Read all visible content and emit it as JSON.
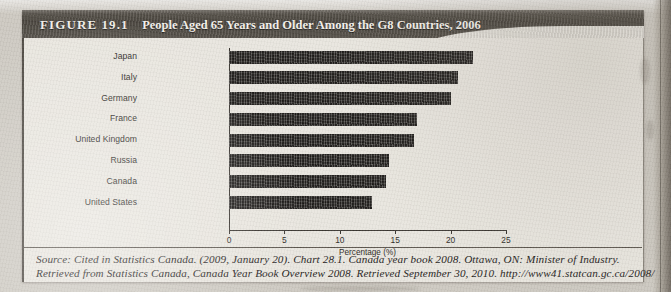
{
  "figure": {
    "number_label": "FIGURE 19.1",
    "title": "People Aged 65 Years and Older Among the G8 Countries, 2006"
  },
  "caption": {
    "line1": "Source: Cited in Statistics Canada. (2009, January 20). Chart 28.1. Canada year book 2008. Ottawa, ON: Minister of Industry.",
    "line2": "Retrieved from Statistics Canada, Canada Year Book Overview 2008. Retrieved September 30, 2010. http://www41.statcan.gc.ca/2008/"
  },
  "chart_data": {
    "type": "bar",
    "orientation": "horizontal",
    "title": "People Aged 65 Years and Older Among the G8 Countries, 2006",
    "xlabel": "Percentage (%)",
    "ylabel": "",
    "xlim": [
      0,
      25
    ],
    "xticks": [
      0,
      5,
      10,
      15,
      20,
      25
    ],
    "grid": false,
    "legend": false,
    "bar_color": "#2e2b27",
    "categories": [
      "Japan",
      "Italy",
      "Germany",
      "France",
      "United Kingdom",
      "Russia",
      "Canada",
      "United States"
    ],
    "values": [
      21.3,
      20.0,
      19.4,
      16.4,
      16.2,
      14.0,
      13.7,
      12.5
    ]
  }
}
